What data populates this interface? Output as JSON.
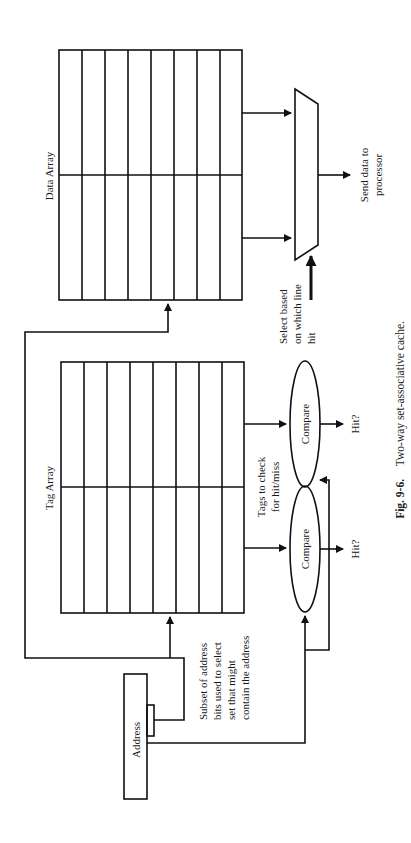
{
  "figure": {
    "caption_number": "Fig. 9-6.",
    "caption_text": "Two-way set-associative cache.",
    "orientation": "rotated-90-ccw"
  },
  "data_array": {
    "label": "Data Array",
    "ways": 2,
    "rows": 8
  },
  "tag_array": {
    "label": "Tag Array",
    "ways": 2,
    "rows": 8
  },
  "address": {
    "label": "Address"
  },
  "annotations": {
    "index_bits": [
      "Subset of address",
      "bits used to select",
      "set that might",
      "contain the address"
    ],
    "tags_check": [
      "Tags to check",
      "for hit/miss"
    ],
    "mux_select": [
      "Select based",
      "on which line",
      "hit"
    ],
    "send_data": [
      "Send data to",
      "processor"
    ]
  },
  "comparators": [
    {
      "label": "Compare",
      "output": "Hit?"
    },
    {
      "label": "Compare",
      "output": "Hit?"
    }
  ],
  "colors": {
    "line": "#111111",
    "text": "#1a1a1a",
    "background": "#ffffff"
  }
}
